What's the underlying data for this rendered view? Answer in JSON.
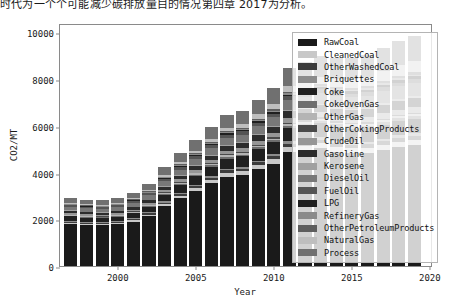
{
  "caption": "时代为一个个可能减少碳排放量目的情况第四章 2017为分析。",
  "chart_data": {
    "type": "bar",
    "stacked": true,
    "title": "",
    "xlabel": "Year",
    "ylabel": "CO2/MT",
    "xlim": [
      1996.3,
      2020.2
    ],
    "ylim": [
      0,
      10400
    ],
    "yticks": [
      0,
      2000,
      4000,
      6000,
      8000,
      10000
    ],
    "ytick_labels": [
      "0",
      "2000",
      "4000",
      "6000",
      "8000",
      "10000"
    ],
    "xticks": [
      2000,
      2005,
      2010,
      2015,
      2020
    ],
    "xtick_labels": [
      "2000",
      "2005",
      "2010",
      "2015",
      "2020"
    ],
    "grid": false,
    "legend_position": "upper right",
    "categories": [
      1997,
      1998,
      1999,
      2000,
      2001,
      2002,
      2003,
      2004,
      2005,
      2006,
      2007,
      2008,
      2009,
      2010,
      2011,
      2012,
      2013,
      2014,
      2015,
      2016,
      2017,
      2018,
      2019
    ],
    "series": [
      {
        "name": "RawCoal",
        "color": "#1a1a1a",
        "values": [
          1800,
          1760,
          1740,
          1790,
          1900,
          2130,
          2560,
          2900,
          3220,
          3540,
          3830,
          3900,
          4140,
          4380,
          4880,
          4940,
          5030,
          4900,
          4840,
          4850,
          4980,
          5100,
          5180
        ]
      },
      {
        "name": "CleanedCoal",
        "color": "#c8c8c8",
        "values": [
          60,
          58,
          57,
          60,
          66,
          74,
          92,
          108,
          122,
          138,
          152,
          158,
          170,
          182,
          204,
          210,
          216,
          212,
          210,
          212,
          218,
          224,
          228
        ]
      },
      {
        "name": "OtherWashedCoal",
        "color": "#3c3c3c",
        "values": [
          44,
          43,
          42,
          44,
          48,
          54,
          66,
          78,
          88,
          100,
          110,
          114,
          122,
          132,
          148,
          152,
          156,
          152,
          150,
          152,
          156,
          160,
          164
        ]
      },
      {
        "name": "Briquettes",
        "color": "#8c8c8c",
        "values": [
          30,
          29,
          29,
          30,
          33,
          37,
          45,
          52,
          59,
          66,
          73,
          76,
          82,
          88,
          98,
          101,
          104,
          101,
          100,
          101,
          104,
          106,
          108
        ]
      },
      {
        "name": "Coke",
        "color": "#202020",
        "values": [
          190,
          186,
          184,
          190,
          206,
          232,
          280,
          320,
          358,
          396,
          430,
          444,
          476,
          510,
          570,
          586,
          600,
          584,
          578,
          582,
          598,
          612,
          624
        ]
      },
      {
        "name": "CokeOvenGas",
        "color": "#6e6e6e",
        "values": [
          34,
          33,
          33,
          34,
          37,
          42,
          50,
          58,
          65,
          72,
          79,
          82,
          88,
          94,
          106,
          109,
          112,
          109,
          108,
          109,
          112,
          115,
          117
        ]
      },
      {
        "name": "OtherGas",
        "color": "#b4b4b4",
        "values": [
          26,
          25,
          25,
          26,
          28,
          32,
          38,
          44,
          50,
          55,
          60,
          62,
          67,
          72,
          80,
          83,
          85,
          83,
          82,
          83,
          85,
          87,
          89
        ]
      },
      {
        "name": "OtherCokingProducts",
        "color": "#4a4a4a",
        "values": [
          18,
          18,
          17,
          18,
          20,
          22,
          27,
          31,
          35,
          38,
          42,
          44,
          47,
          50,
          56,
          58,
          60,
          58,
          58,
          58,
          60,
          61,
          62
        ]
      },
      {
        "name": "CrudeOil",
        "color": "#969696",
        "values": [
          70,
          69,
          68,
          70,
          76,
          85,
          103,
          118,
          132,
          146,
          159,
          164,
          176,
          188,
          210,
          216,
          222,
          216,
          214,
          216,
          222,
          227,
          232
        ]
      },
      {
        "name": "Gasoline",
        "color": "#2c2c2c",
        "values": [
          92,
          91,
          90,
          96,
          104,
          115,
          132,
          148,
          162,
          178,
          194,
          204,
          224,
          244,
          268,
          284,
          300,
          312,
          326,
          340,
          356,
          372,
          388
        ]
      },
      {
        "name": "Kerosene",
        "color": "#a0a0a0",
        "values": [
          20,
          20,
          20,
          21,
          23,
          25,
          29,
          33,
          36,
          40,
          44,
          46,
          50,
          55,
          61,
          65,
          69,
          73,
          78,
          82,
          87,
          92,
          97
        ]
      },
      {
        "name": "DieselOil",
        "color": "#787878",
        "values": [
          140,
          139,
          138,
          146,
          158,
          176,
          204,
          228,
          250,
          274,
          298,
          312,
          340,
          370,
          406,
          428,
          450,
          466,
          484,
          502,
          522,
          542,
          562
        ]
      },
      {
        "name": "FuelOil",
        "color": "#545454",
        "values": [
          78,
          77,
          76,
          78,
          84,
          93,
          110,
          124,
          136,
          148,
          158,
          158,
          162,
          166,
          172,
          172,
          170,
          164,
          158,
          154,
          152,
          150,
          148
        ]
      },
      {
        "name": "LPG",
        "color": "#1f1f1f",
        "values": [
          22,
          23,
          24,
          26,
          29,
          33,
          39,
          44,
          49,
          54,
          59,
          62,
          68,
          74,
          82,
          88,
          94,
          99,
          105,
          110,
          116,
          122,
          128
        ]
      },
      {
        "name": "RefineryGas",
        "color": "#8a8a8a",
        "values": [
          16,
          16,
          16,
          17,
          18,
          20,
          24,
          27,
          30,
          33,
          36,
          38,
          41,
          45,
          50,
          53,
          56,
          58,
          61,
          63,
          66,
          69,
          72
        ]
      },
      {
        "name": "OtherPetroleumProducts",
        "color": "#5e5e5e",
        "values": [
          24,
          24,
          24,
          25,
          27,
          30,
          36,
          41,
          45,
          50,
          54,
          57,
          62,
          67,
          74,
          78,
          82,
          85,
          89,
          92,
          96,
          100,
          104
        ]
      },
      {
        "name": "NaturalGas",
        "color": "#bebebe",
        "values": [
          36,
          37,
          39,
          43,
          49,
          57,
          70,
          84,
          100,
          118,
          140,
          155,
          180,
          210,
          250,
          280,
          310,
          334,
          360,
          390,
          424,
          460,
          496
        ]
      },
      {
        "name": "Process",
        "color": "#707070",
        "values": [
          200,
          200,
          200,
          210,
          230,
          268,
          330,
          390,
          448,
          506,
          560,
          584,
          636,
          690,
          770,
          818,
          866,
          892,
          920,
          948,
          982,
          1016,
          1050
        ]
      }
    ]
  }
}
